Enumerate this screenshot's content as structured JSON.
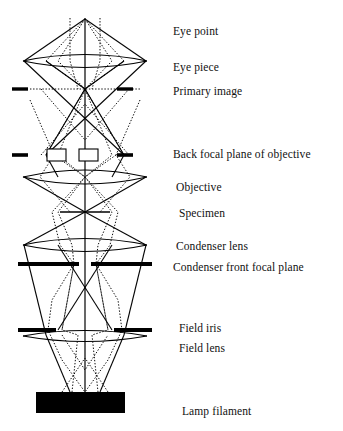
{
  "figure": {
    "background_color": "#ffffff",
    "ink_color": "#000000",
    "width": 343,
    "height": 431
  },
  "labels": [
    {
      "id": "eye-point",
      "text": "Eye point",
      "x": 173,
      "y": 25
    },
    {
      "id": "eye-piece",
      "text": "Eye piece",
      "x": 173,
      "y": 61
    },
    {
      "id": "primary-image",
      "text": "Primary image",
      "x": 173,
      "y": 85
    },
    {
      "id": "back-focal-plane-objective",
      "text": "Back focal plane of objective",
      "x": 173,
      "y": 148
    },
    {
      "id": "objective",
      "text": "Objective",
      "x": 176,
      "y": 181
    },
    {
      "id": "specimen",
      "text": "Specimen",
      "x": 179,
      "y": 207
    },
    {
      "id": "condenser-lens",
      "text": "Condenser lens",
      "x": 176,
      "y": 240
    },
    {
      "id": "condenser-front-focal-plane",
      "text": "Condenser front focal plane",
      "x": 173,
      "y": 261
    },
    {
      "id": "field-iris",
      "text": "Field iris",
      "x": 179,
      "y": 322
    },
    {
      "id": "field-lens",
      "text": "Field lens",
      "x": 179,
      "y": 342
    },
    {
      "id": "lamp-filament",
      "text": "Lamp filament",
      "x": 182,
      "y": 405
    }
  ],
  "optical_elements": [
    {
      "id": "eye-piece-lens",
      "kind": "lens",
      "axis_y": 61,
      "half_width": 62,
      "bulge": 13
    },
    {
      "id": "primary-image-plane",
      "kind": "dashed-plane",
      "axis_y": 89,
      "stub_inner": 28,
      "stub_outer": 62
    },
    {
      "id": "back-focal-plane",
      "kind": "stub-plane",
      "axis_y": 155,
      "stub_inner": 36,
      "stub_outer": 62
    },
    {
      "id": "diffraction-spot-left",
      "kind": "spot-box",
      "axis_y": 155,
      "cx": -29,
      "w": 19,
      "h": 11
    },
    {
      "id": "diffraction-spot-right",
      "kind": "spot-box",
      "axis_y": 155,
      "cx": 3,
      "w": 19,
      "h": 11
    },
    {
      "id": "objective-lens",
      "kind": "lens",
      "axis_y": 177,
      "half_width": 62,
      "bulge": 14
    },
    {
      "id": "specimen-plane",
      "kind": "short-plane",
      "axis_y": 212,
      "half_width": 25
    },
    {
      "id": "condenser-lens-element",
      "kind": "lens",
      "axis_y": 245,
      "half_width": 62,
      "bulge": 13
    },
    {
      "id": "condenser-front-focal-plane",
      "kind": "thick-bar",
      "axis_y": 264,
      "gap": 8,
      "half_width": 62
    },
    {
      "id": "field-iris-plane",
      "kind": "thick-bar",
      "axis_y": 330,
      "gap": 34,
      "half_width": 62
    },
    {
      "id": "field-lens-element",
      "kind": "lens",
      "axis_y": 335,
      "half_width": 62,
      "bulge": 11
    },
    {
      "id": "lamp-filament-block",
      "kind": "filled-block",
      "x": 36,
      "y": 392,
      "w": 89,
      "h": 21
    }
  ],
  "ray_paths": {
    "image_forming": {
      "style": "solid",
      "description": "Specimen-conjugate rays: lamp filament – field lens – condenser – specimen – objective – primary image – eye piece – eye point"
    },
    "illumination": {
      "style": "dotted",
      "description": "Aperture-conjugate rays: field iris – condenser front focal plane – back focal plane of objective – eye point"
    },
    "optic_axis": {
      "style": "solid-vertical",
      "x": 85,
      "y_top": 18,
      "y_bottom": 400
    }
  }
}
